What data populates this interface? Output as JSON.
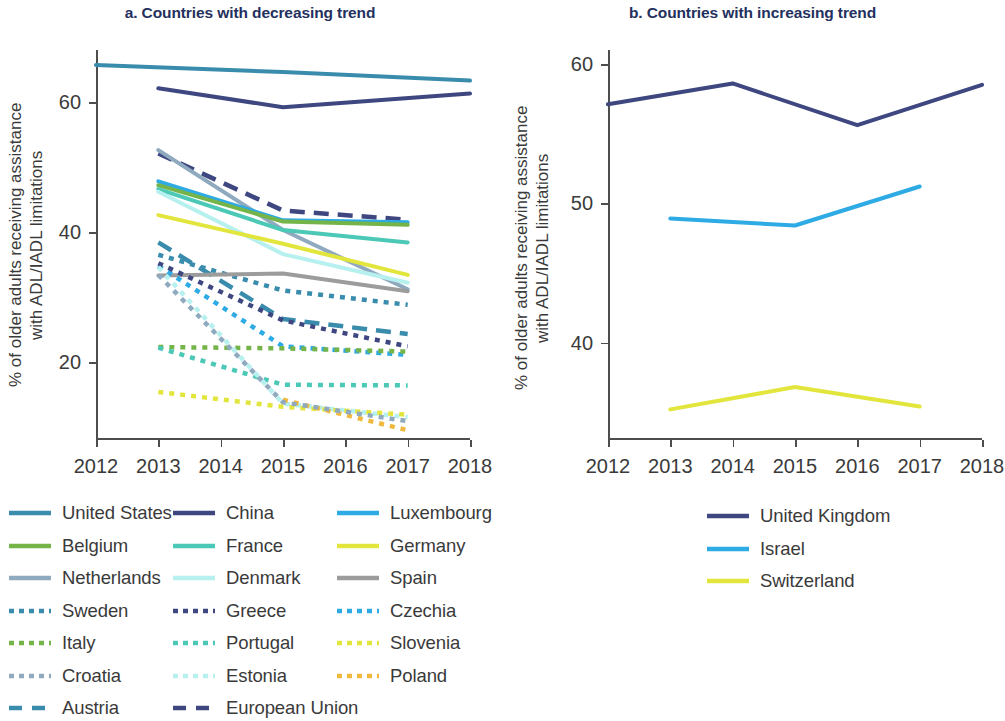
{
  "panels": {
    "a": {
      "title": "a. Countries with decreasing trend",
      "ylabel": "% of older adults receiving assistance\nwith ADL/IADL limitations",
      "yticks": [
        "20",
        "40",
        "60"
      ],
      "xticks": [
        "2012",
        "2013",
        "2014",
        "2015",
        "2016",
        "2017",
        "2018"
      ]
    },
    "b": {
      "title": "b. Countries with increasing trend",
      "ylabel": "% of older adults receiving assistance\nwith ADL/IADL limitations",
      "yticks": [
        "40",
        "50",
        "60"
      ],
      "xticks": [
        "2012",
        "2013",
        "2014",
        "2015",
        "2016",
        "2017",
        "2018"
      ]
    }
  },
  "legend_a": [
    [
      {
        "label": "United States",
        "color": "#3a8cad",
        "style": "solid"
      },
      {
        "label": "China",
        "color": "#3e4780",
        "style": "solid"
      },
      {
        "label": "Luxembourg",
        "color": "#2eaae4",
        "style": "solid"
      }
    ],
    [
      {
        "label": "Belgium",
        "color": "#74b449",
        "style": "solid"
      },
      {
        "label": "France",
        "color": "#4cc8b6",
        "style": "solid"
      },
      {
        "label": "Germany",
        "color": "#e2e63c",
        "style": "solid"
      }
    ],
    [
      {
        "label": "Netherlands",
        "color": "#8fa9bf",
        "style": "solid"
      },
      {
        "label": "Denmark",
        "color": "#b6f0ef",
        "style": "solid"
      },
      {
        "label": "Spain",
        "color": "#9c9c9c",
        "style": "solid"
      }
    ],
    [
      {
        "label": "Sweden",
        "color": "#3a8cad",
        "style": "dotted"
      },
      {
        "label": "Greece",
        "color": "#3e4780",
        "style": "dotted"
      },
      {
        "label": "Czechia",
        "color": "#2eaae4",
        "style": "dotted"
      }
    ],
    [
      {
        "label": "Italy",
        "color": "#74b449",
        "style": "dotted"
      },
      {
        "label": "Portugal",
        "color": "#4cc8b6",
        "style": "dotted"
      },
      {
        "label": "Slovenia",
        "color": "#e2e63c",
        "style": "dotted"
      }
    ],
    [
      {
        "label": "Croatia",
        "color": "#8fa9bf",
        "style": "dotted"
      },
      {
        "label": "Estonia",
        "color": "#b6f0ef",
        "style": "dotted"
      },
      {
        "label": "Poland",
        "color": "#f0b93e",
        "style": "dotted"
      }
    ],
    [
      {
        "label": "Austria",
        "color": "#3a8cad",
        "style": "dashed"
      },
      {
        "label": "European Union",
        "color": "#3e4780",
        "style": "dashed"
      }
    ]
  ],
  "legend_b": [
    [
      {
        "label": "United Kingdom",
        "color": "#3e4780",
        "style": "solid"
      }
    ],
    [
      {
        "label": "Israel",
        "color": "#2eaae4",
        "style": "solid"
      }
    ],
    [
      {
        "label": "Switzerland",
        "color": "#e2e63c",
        "style": "solid"
      }
    ]
  ],
  "chart_data": [
    {
      "type": "line",
      "title": "a. Countries with decreasing trend",
      "xlabel": "",
      "ylabel": "% of older adults receiving assistance with ADL/IADL limitations",
      "xlim": [
        2012,
        2018
      ],
      "ylim": [
        8,
        68
      ],
      "yticks": [
        20,
        40,
        60
      ],
      "xticks": [
        2012,
        2013,
        2014,
        2015,
        2016,
        2017,
        2018
      ],
      "grid": false,
      "legend_position": "below",
      "series": [
        {
          "name": "United States",
          "color": "#3a8cad",
          "style": "solid",
          "x": [
            2012,
            2015,
            2018
          ],
          "values": [
            65.7,
            64.6,
            63.3
          ]
        },
        {
          "name": "China",
          "color": "#3e4780",
          "style": "solid",
          "x": [
            2013,
            2015,
            2018
          ],
          "values": [
            62.1,
            59.2,
            61.3
          ]
        },
        {
          "name": "European Union",
          "color": "#3e4780",
          "style": "dashed",
          "x": [
            2013,
            2015,
            2017
          ],
          "values": [
            52.1,
            43.3,
            41.9
          ]
        },
        {
          "name": "Netherlands",
          "color": "#8fa9bf",
          "style": "solid",
          "x": [
            2013,
            2015,
            2017
          ],
          "values": [
            52.6,
            40.3,
            31.2
          ]
        },
        {
          "name": "Luxembourg",
          "color": "#2eaae4",
          "style": "solid",
          "x": [
            2013,
            2015,
            2017
          ],
          "values": [
            47.8,
            41.8,
            41.5
          ]
        },
        {
          "name": "Belgium",
          "color": "#74b449",
          "style": "solid",
          "x": [
            2013,
            2015,
            2017
          ],
          "values": [
            47.2,
            41.6,
            41.1
          ]
        },
        {
          "name": "France",
          "color": "#4cc8b6",
          "style": "solid",
          "x": [
            2013,
            2015,
            2017
          ],
          "values": [
            46.6,
            40.3,
            38.4
          ]
        },
        {
          "name": "Denmark",
          "color": "#b6f0ef",
          "style": "solid",
          "x": [
            2013,
            2015,
            2017
          ],
          "values": [
            46.2,
            36.6,
            32.2
          ]
        },
        {
          "name": "Germany",
          "color": "#e2e63c",
          "style": "solid",
          "x": [
            2013,
            2015,
            2017
          ],
          "values": [
            42.6,
            38.2,
            33.4
          ]
        },
        {
          "name": "Austria",
          "color": "#3a8cad",
          "style": "dashed",
          "x": [
            2013,
            2015,
            2017
          ],
          "values": [
            38.4,
            26.6,
            24.3
          ]
        },
        {
          "name": "Sweden",
          "color": "#3a8cad",
          "style": "dotted",
          "x": [
            2013,
            2015,
            2017
          ],
          "values": [
            36.5,
            31.0,
            28.8
          ]
        },
        {
          "name": "Spain",
          "color": "#9c9c9c",
          "style": "solid",
          "x": [
            2013,
            2015,
            2017
          ],
          "values": [
            33.3,
            33.6,
            30.9
          ]
        },
        {
          "name": "Czechia",
          "color": "#2eaae4",
          "style": "dotted",
          "x": [
            2013,
            2015,
            2017
          ],
          "values": [
            34.8,
            22.4,
            21.1
          ]
        },
        {
          "name": "Greece",
          "color": "#3e4780",
          "style": "dotted",
          "x": [
            2013,
            2015,
            2017
          ],
          "values": [
            35.2,
            26.4,
            22.4
          ]
        },
        {
          "name": "Italy",
          "color": "#74b449",
          "style": "dotted",
          "x": [
            2013,
            2015,
            2017
          ],
          "values": [
            22.3,
            22.1,
            21.6
          ]
        },
        {
          "name": "Portugal",
          "color": "#4cc8b6",
          "style": "dotted",
          "x": [
            2013,
            2015,
            2017
          ],
          "values": [
            22.2,
            16.5,
            16.4
          ]
        },
        {
          "name": "Estonia",
          "color": "#b6f0ef",
          "style": "dotted",
          "x": [
            2013,
            2015,
            2017
          ],
          "values": [
            34.6,
            13.6,
            11.5
          ]
        },
        {
          "name": "Slovenia",
          "color": "#e2e63c",
          "style": "dotted",
          "x": [
            2013,
            2015,
            2017
          ],
          "values": [
            15.4,
            13.1,
            11.9
          ]
        },
        {
          "name": "Poland",
          "color": "#f0b93e",
          "style": "dotted",
          "x": [
            2015,
            2017
          ],
          "values": [
            14.2,
            9.5
          ]
        },
        {
          "name": "Croatia",
          "color": "#8fa9bf",
          "style": "dotted",
          "x": [
            2013,
            2015,
            2017
          ],
          "values": [
            33.4,
            13.8,
            10.9
          ]
        }
      ]
    },
    {
      "type": "line",
      "title": "b. Countries with increasing trend",
      "xlabel": "",
      "ylabel": "% of older adults receiving assistance with ADL/IADL limitations",
      "xlim": [
        2012,
        2018
      ],
      "ylim": [
        33,
        61
      ],
      "yticks": [
        40,
        50,
        60
      ],
      "xticks": [
        2012,
        2013,
        2014,
        2015,
        2016,
        2017,
        2018
      ],
      "grid": false,
      "legend_position": "below",
      "series": [
        {
          "name": "United Kingdom",
          "color": "#3e4780",
          "style": "solid",
          "x": [
            2012,
            2014,
            2016,
            2018
          ],
          "values": [
            57.1,
            58.6,
            55.6,
            58.5
          ]
        },
        {
          "name": "Israel",
          "color": "#2eaae4",
          "style": "solid",
          "x": [
            2013,
            2015,
            2017
          ],
          "values": [
            48.9,
            48.4,
            51.2
          ]
        },
        {
          "name": "Switzerland",
          "color": "#e2e63c",
          "style": "solid",
          "x": [
            2013,
            2015,
            2017
          ],
          "values": [
            35.2,
            36.8,
            35.4
          ]
        }
      ]
    }
  ]
}
